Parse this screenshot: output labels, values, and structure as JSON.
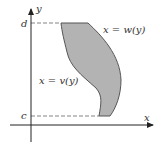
{
  "diagram": {
    "title": "",
    "axes": {
      "x_label": "x",
      "y_label": "y"
    },
    "bounds": {
      "lower_label": "c",
      "upper_label": "d"
    },
    "curves": {
      "left": {
        "label": "x = v(y)"
      },
      "right": {
        "label": "x = w(y)"
      }
    },
    "colors": {
      "region_fill": "#b0b0b0",
      "region_stroke": "#555555",
      "axis": "#222222",
      "dashed": "#666666",
      "text": "#333333"
    }
  }
}
